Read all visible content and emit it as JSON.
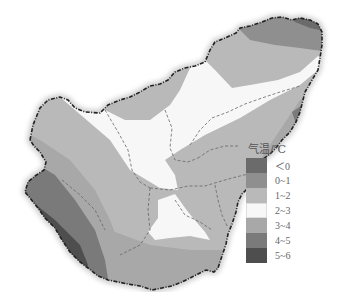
{
  "map": {
    "title": "",
    "description": "Grayscale temperature map of a region with dashed provincial boundaries",
    "regions": [
      {
        "class": "<0",
        "color": "#6b6b6b"
      },
      {
        "class": "0~1",
        "color": "#8f8f8f"
      },
      {
        "class": "1~2",
        "color": "#b9b9b9"
      },
      {
        "class": "2~3",
        "color": "#f7f7f7"
      },
      {
        "class": "3~4",
        "color": "#a8a8a8"
      },
      {
        "class": "4~5",
        "color": "#7a7a7a"
      },
      {
        "class": "5~6",
        "color": "#4e4e4e"
      }
    ]
  },
  "legend": {
    "title": "气温/℃",
    "items": [
      {
        "label": "＜0",
        "color": "#6b6b6b"
      },
      {
        "label": "0~1",
        "color": "#8f8f8f"
      },
      {
        "label": "1~2",
        "color": "#b9b9b9"
      },
      {
        "label": "2~3",
        "color": "#f7f7f7"
      },
      {
        "label": "3~4",
        "color": "#a8a8a8"
      },
      {
        "label": "4~5",
        "color": "#7a7a7a"
      },
      {
        "label": "5~6",
        "color": "#4e4e4e"
      }
    ]
  }
}
